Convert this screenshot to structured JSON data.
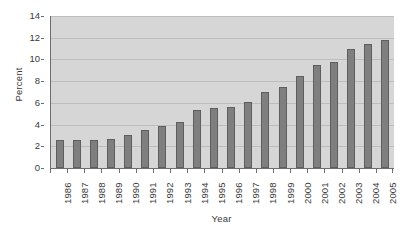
{
  "chart_data": {
    "type": "bar",
    "title": "",
    "subtitle": "",
    "xlabel": "Year",
    "ylabel": "Percent",
    "categories": [
      "1986",
      "1987",
      "1988",
      "1989",
      "1990",
      "1991",
      "1992",
      "1993",
      "1994",
      "1995",
      "1996",
      "1997",
      "1998",
      "1999",
      "2000",
      "2001",
      "2002",
      "2003",
      "2004",
      "2005"
    ],
    "values": [
      2.6,
      2.6,
      2.6,
      2.7,
      3.0,
      3.5,
      3.9,
      4.2,
      5.3,
      5.5,
      5.6,
      6.1,
      7.0,
      7.5,
      8.5,
      9.5,
      9.8,
      11.0,
      11.4,
      11.8
    ],
    "ylim": [
      0,
      14
    ],
    "ytick_values": [
      0,
      2,
      4,
      6,
      8,
      10,
      12,
      14
    ],
    "ytick_labels": [
      "0",
      "2",
      "4",
      "6",
      "8",
      "10",
      "12",
      "14"
    ],
    "grid": true,
    "grid_axis": "y",
    "legend": false,
    "legend_position": "none",
    "series": [
      {
        "name": "Percent",
        "values": [
          2.6,
          2.6,
          2.6,
          2.7,
          3.0,
          3.5,
          3.9,
          4.2,
          5.3,
          5.5,
          5.6,
          6.1,
          7.0,
          7.5,
          8.5,
          9.5,
          9.8,
          11.0,
          11.4,
          11.8
        ]
      }
    ],
    "colors": {
      "bar_fill": "#7f7f7f",
      "bar_border": "#5e5e5e",
      "plot_background": "#d6d6d6",
      "gridline": "#bdbdbd",
      "axis_line": "#6d6d6d",
      "page_background": "#ffffff",
      "text": "#3a3a3a"
    },
    "xtick_rotation": -90
  }
}
